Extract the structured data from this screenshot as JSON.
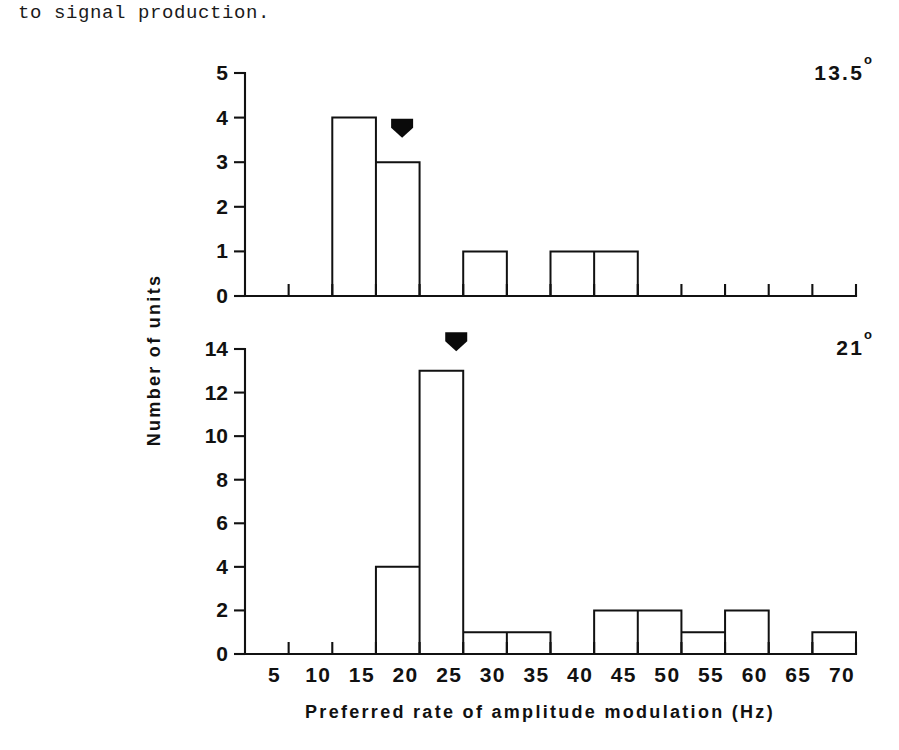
{
  "document": {
    "body_text": "to signal production."
  },
  "figure": {
    "y_axis_title": "Number of units",
    "x_axis_title": "Preferred rate of amplitude modulation (Hz)"
  },
  "chart_data": [
    {
      "type": "bar",
      "id": "panel-top",
      "panel_label": "13.5",
      "panel_label_unit": "o",
      "title": "",
      "xlabel": "Preferred rate of amplitude modulation (Hz)",
      "ylabel": "Number of units",
      "bin_width": 5,
      "xlim": [
        0,
        70
      ],
      "ylim": [
        0,
        5
      ],
      "xticks": [
        5,
        10,
        15,
        20,
        25,
        30,
        35,
        40,
        45,
        50,
        55,
        60,
        65,
        70
      ],
      "xtick_labels": [
        "5",
        "10",
        "15",
        "20",
        "25",
        "30",
        "35",
        "40",
        "45",
        "50",
        "55",
        "60",
        "65",
        "70"
      ],
      "yticks": [
        0,
        1,
        2,
        3,
        4,
        5
      ],
      "ytick_labels": [
        "0",
        "1",
        "2",
        "3",
        "4",
        "5"
      ],
      "grid": false,
      "bins": [
        {
          "start": 0,
          "end": 5,
          "value": 0
        },
        {
          "start": 5,
          "end": 10,
          "value": 0
        },
        {
          "start": 10,
          "end": 15,
          "value": 4
        },
        {
          "start": 15,
          "end": 20,
          "value": 3
        },
        {
          "start": 20,
          "end": 25,
          "value": 0
        },
        {
          "start": 25,
          "end": 30,
          "value": 1
        },
        {
          "start": 30,
          "end": 35,
          "value": 0
        },
        {
          "start": 35,
          "end": 40,
          "value": 1
        },
        {
          "start": 40,
          "end": 45,
          "value": 1
        },
        {
          "start": 45,
          "end": 50,
          "value": 0
        },
        {
          "start": 50,
          "end": 55,
          "value": 0
        },
        {
          "start": 55,
          "end": 60,
          "value": 0
        },
        {
          "start": 60,
          "end": 65,
          "value": 0
        },
        {
          "start": 65,
          "end": 70,
          "value": 0
        }
      ],
      "annotations": [
        {
          "name": "mean-arrow",
          "x": 18.0,
          "y": 3.55,
          "marker": "down-arrow"
        }
      ]
    },
    {
      "type": "bar",
      "id": "panel-bottom",
      "panel_label": "21",
      "panel_label_unit": "o",
      "title": "",
      "xlabel": "Preferred rate of amplitude modulation (Hz)",
      "ylabel": "Number of units",
      "bin_width": 5,
      "xlim": [
        0,
        70
      ],
      "ylim": [
        0,
        14
      ],
      "xticks": [
        5,
        10,
        15,
        20,
        25,
        30,
        35,
        40,
        45,
        50,
        55,
        60,
        65,
        70
      ],
      "xtick_labels": [
        "5",
        "10",
        "15",
        "20",
        "25",
        "30",
        "35",
        "40",
        "45",
        "50",
        "55",
        "60",
        "65",
        "70"
      ],
      "yticks": [
        0,
        2,
        4,
        6,
        8,
        10,
        12,
        14
      ],
      "ytick_labels": [
        "0",
        "2",
        "4",
        "6",
        "8",
        "10",
        "12",
        "14"
      ],
      "grid": false,
      "bins": [
        {
          "start": 0,
          "end": 5,
          "value": 0
        },
        {
          "start": 5,
          "end": 10,
          "value": 0
        },
        {
          "start": 10,
          "end": 15,
          "value": 0
        },
        {
          "start": 15,
          "end": 20,
          "value": 4
        },
        {
          "start": 20,
          "end": 25,
          "value": 13
        },
        {
          "start": 25,
          "end": 30,
          "value": 1
        },
        {
          "start": 30,
          "end": 35,
          "value": 1
        },
        {
          "start": 35,
          "end": 40,
          "value": 0
        },
        {
          "start": 40,
          "end": 45,
          "value": 2
        },
        {
          "start": 45,
          "end": 50,
          "value": 2
        },
        {
          "start": 50,
          "end": 55,
          "value": 1
        },
        {
          "start": 55,
          "end": 60,
          "value": 2
        },
        {
          "start": 60,
          "end": 65,
          "value": 0
        },
        {
          "start": 65,
          "end": 70,
          "value": 1
        }
      ],
      "annotations": [
        {
          "name": "mean-arrow",
          "x": 24.2,
          "y": 13.9,
          "marker": "down-arrow"
        }
      ]
    }
  ]
}
